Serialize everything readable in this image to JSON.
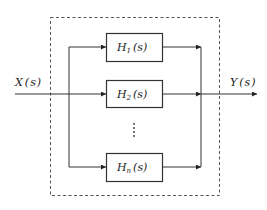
{
  "diagram": {
    "type": "block-diagram",
    "input": {
      "label": "X(s)",
      "var": "X",
      "arg": "s"
    },
    "output": {
      "label": "Y(s)",
      "var": "Y",
      "arg": "s"
    },
    "blocks": [
      {
        "label": "H1(s)",
        "var": "H",
        "sub": "1",
        "arg": "s"
      },
      {
        "label": "H2(s)",
        "var": "H",
        "sub": "2",
        "arg": "s"
      },
      {
        "label": "Hn(s)",
        "var": "H",
        "sub": "n",
        "arg": "s"
      }
    ],
    "ellipsis": "⋮",
    "colors": {
      "line": "#333333",
      "dashed_border": "#555555",
      "background": "#ffffff"
    }
  }
}
